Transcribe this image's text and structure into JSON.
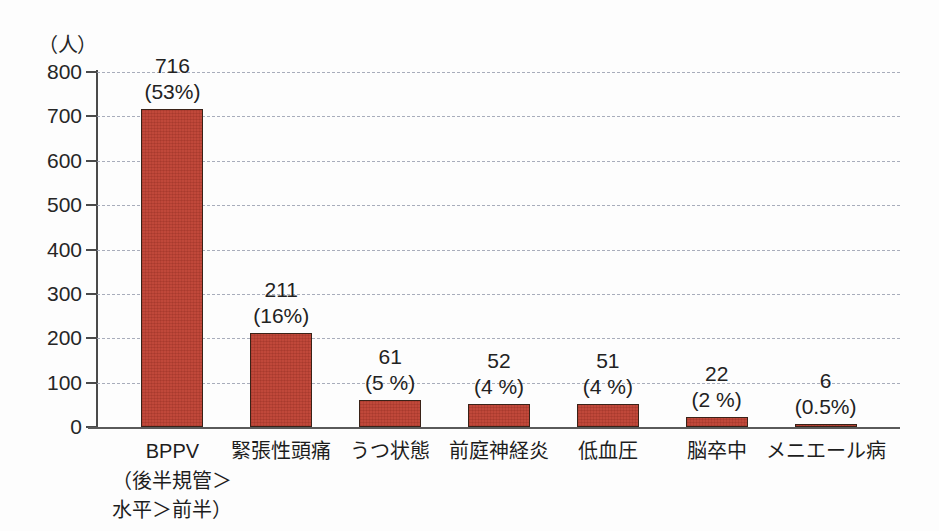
{
  "chart_data": {
    "type": "bar",
    "title": "",
    "xlabel": "",
    "ylabel": "（人）",
    "unit_label": "（人）",
    "ylim": [
      0,
      800
    ],
    "ytick_step": 100,
    "yticks": [
      "800",
      "700",
      "600",
      "500",
      "400",
      "300",
      "200",
      "100",
      "0"
    ],
    "grid": true,
    "legend": "none",
    "bar_color": "#c0483a",
    "bar_border_color": "#3a2218",
    "grid_color": "#9aa0b0",
    "axis_color": "#4a4a4a",
    "categories": [
      "BPPV",
      "緊張性頭痛",
      "うつ状態",
      "前庭神経炎",
      "低血圧",
      "脳卒中",
      "メニエール病"
    ],
    "category_sublabels": [
      [
        "（後半規管＞",
        "水平＞前半）"
      ],
      null,
      null,
      null,
      null,
      null,
      null
    ],
    "values": [
      716,
      211,
      61,
      52,
      51,
      22,
      6
    ],
    "value_labels": [
      "716",
      "211",
      "61",
      "52",
      "51",
      "22",
      "6"
    ],
    "percent_labels": [
      "(53%)",
      "(16%)",
      "(5 %)",
      "(4 %)",
      "(4 %)",
      "(2 %)",
      "(0.5%)"
    ]
  }
}
